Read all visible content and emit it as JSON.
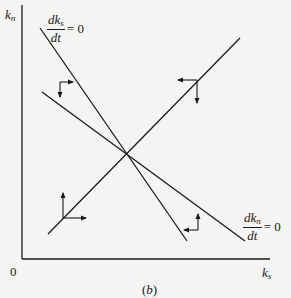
{
  "axes": {
    "y_label_main": "k",
    "y_label_sub": "n",
    "x_label_main": "k",
    "x_label_sub": "s",
    "origin": "0"
  },
  "curves": {
    "ks_locus": {
      "num_main": "dk",
      "num_sub": "s",
      "den": "dt",
      "eq": "= 0"
    },
    "kn_locus": {
      "num_main": "dk",
      "num_sub": "n",
      "den": "dt",
      "eq": "= 0"
    }
  },
  "caption": {
    "open": "(",
    "letter": "b",
    "close": ")"
  },
  "colors": {
    "ink": "#1a1a1a",
    "paper": "#f4f4f2"
  },
  "arrows": [
    {
      "region": "upper-left",
      "directions": [
        "right",
        "down"
      ]
    },
    {
      "region": "upper-right",
      "directions": [
        "left",
        "down"
      ]
    },
    {
      "region": "lower-left",
      "directions": [
        "right",
        "up"
      ]
    },
    {
      "region": "lower-right",
      "directions": [
        "left",
        "up"
      ]
    }
  ]
}
